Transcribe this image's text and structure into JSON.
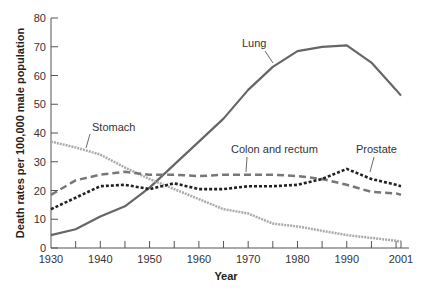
{
  "chart_data": {
    "type": "line",
    "title": "",
    "xlabel": "Year",
    "ylabel": "Death rates per 100,000 male population",
    "xlim": [
      1930,
      2001
    ],
    "ylim": [
      0,
      80
    ],
    "x_ticks": [
      1930,
      1940,
      1950,
      1960,
      1970,
      1980,
      1990,
      2001
    ],
    "y_ticks": [
      0,
      10,
      20,
      30,
      40,
      50,
      60,
      70,
      80
    ],
    "grid": false,
    "legend": "inline labels",
    "x": [
      1930,
      1935,
      1940,
      1945,
      1950,
      1955,
      1960,
      1965,
      1970,
      1975,
      1980,
      1985,
      1990,
      1995,
      2000,
      2001
    ],
    "series": [
      {
        "name": "Lung",
        "style": "solid",
        "color": "#666666",
        "values": [
          4.5,
          6.5,
          11,
          14.5,
          21,
          29,
          37,
          45,
          55,
          63,
          68.5,
          70,
          70.5,
          64.5,
          55,
          53
        ]
      },
      {
        "name": "Stomach",
        "style": "dotted",
        "color": "#aaaaaa",
        "values": [
          37,
          35,
          32.5,
          28,
          24,
          20.5,
          17,
          13.5,
          12,
          8.5,
          7.5,
          6,
          4.5,
          3.5,
          2.5,
          2.3
        ]
      },
      {
        "name": "Colon and rectum",
        "style": "dashed",
        "color": "#777777",
        "values": [
          18.5,
          23.5,
          25.5,
          26.5,
          25.5,
          25.5,
          25,
          25.5,
          25.5,
          25.5,
          25,
          24,
          22,
          19.5,
          19,
          18.5
        ]
      },
      {
        "name": "Prostate",
        "style": "short-dashed",
        "color": "#222222",
        "values": [
          13.5,
          17.5,
          21.5,
          22,
          20.5,
          22.5,
          20.5,
          20.5,
          21.5,
          21.5,
          22,
          24,
          27.5,
          24,
          22,
          21.5
        ]
      }
    ],
    "annotations": [
      {
        "text": "Lung",
        "x": 1977,
        "y": 63
      },
      {
        "text": "Stomach",
        "x": 1936,
        "y": 34
      },
      {
        "text": "Colon and rectum",
        "x": 1969,
        "y": 25.5
      },
      {
        "text": "Prostate",
        "x": 1995,
        "y": 24
      }
    ]
  }
}
